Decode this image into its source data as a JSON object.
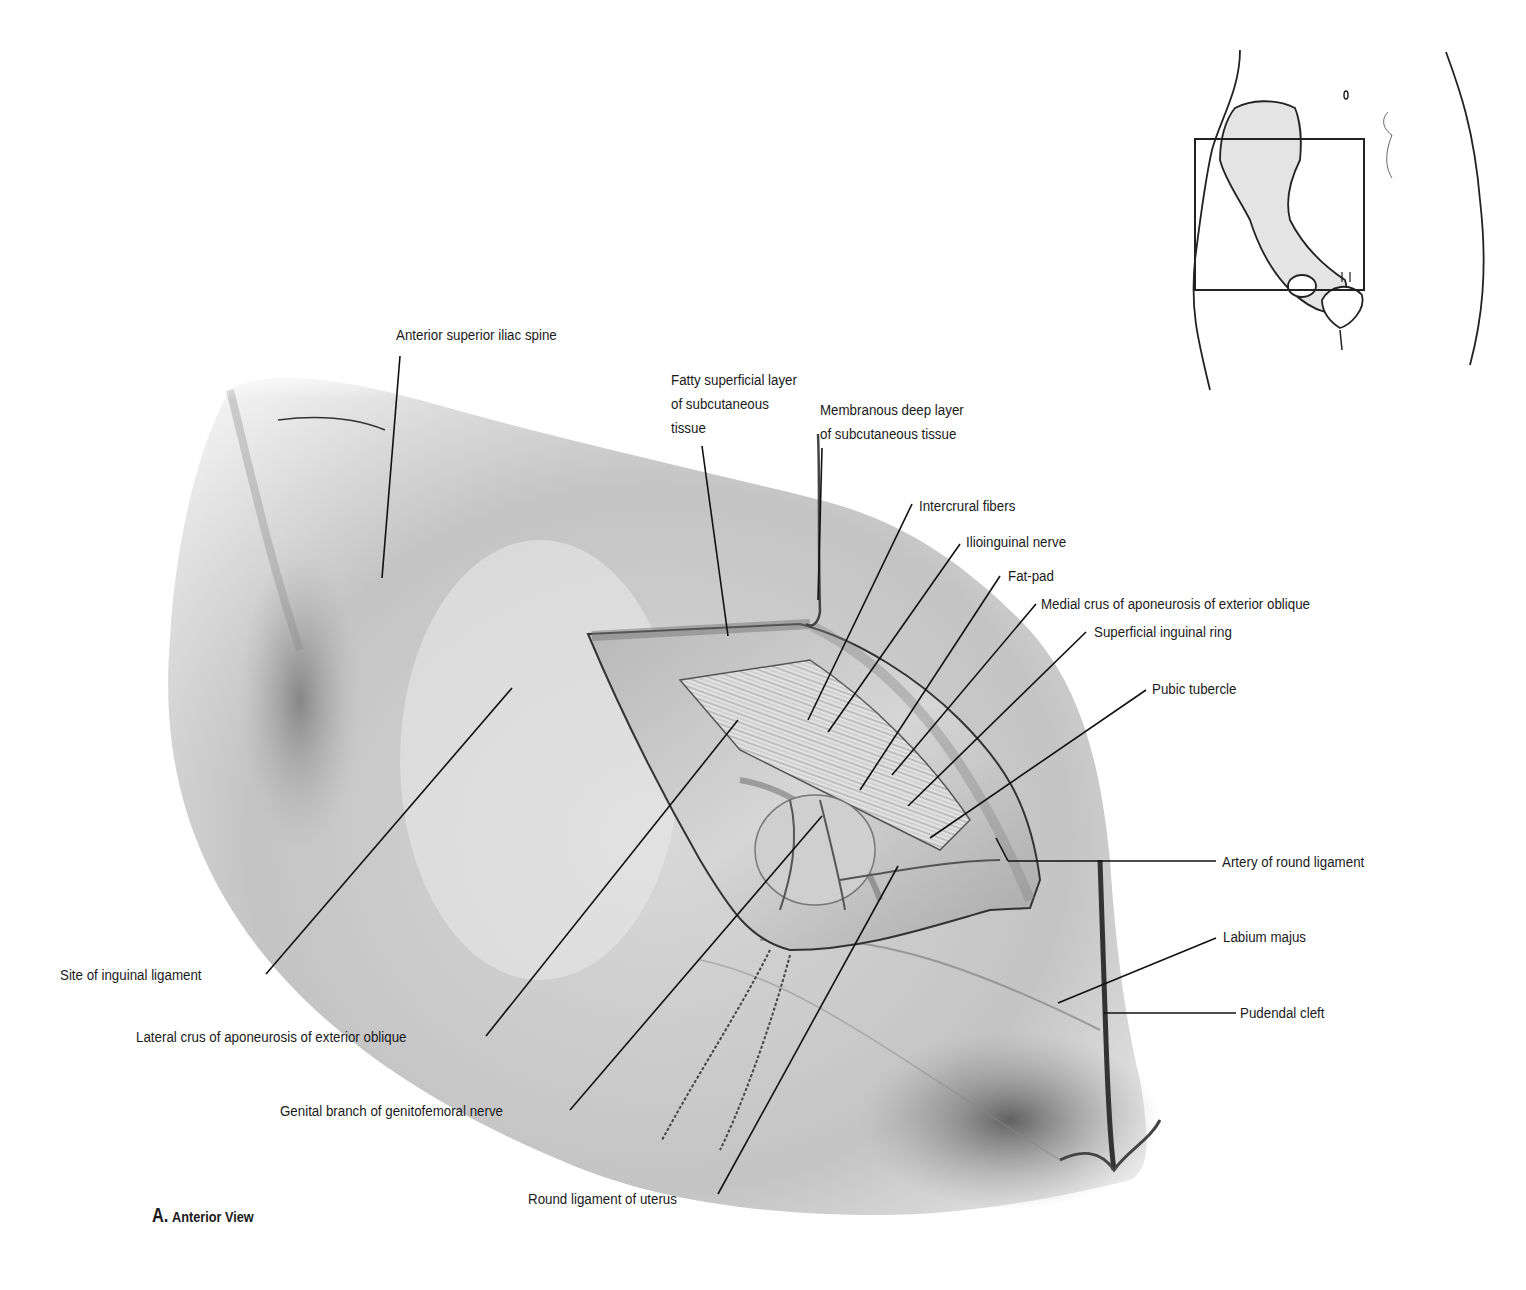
{
  "figure": {
    "caption_letter": "A.",
    "caption_text": "Anterior View",
    "view": "Anterior view of inguinal region (female), superficial dissection",
    "signature": "Dchubb",
    "colors": {
      "background": "#ffffff",
      "ink": "#1a1a1a",
      "skin_shade": "#9a9a9a",
      "leader_line": "#111111"
    }
  },
  "labels": {
    "asis": "Anterior superior iliac spine",
    "fatty_1": "Fatty superficial layer",
    "fatty_2": "of subcutaneous",
    "fatty_3": "tissue",
    "membranous_1": "Membranous deep layer",
    "membranous_2": "of subcutaneous tissue",
    "intercrural": "Intercrural fibers",
    "ilioinguinal": "Ilioinguinal nerve",
    "fatpad": "Fat-pad",
    "medial_crus": "Medial crus of aponeurosis of exterior oblique",
    "superficial_ring": "Superficial inguinal ring",
    "pubic_tubercle": "Pubic tubercle",
    "artery_round": "Artery of round ligament",
    "labium": "Labium majus",
    "pudendal": "Pudendal cleft",
    "site_inguinal": "Site of inguinal ligament",
    "lateral_crus": "Lateral crus of aponeurosis of exterior oblique",
    "genital_branch": "Genital branch of genitofemoral nerve",
    "round_ligament": "Round ligament of uterus"
  },
  "inset": {
    "description": "Orientation sketch of female pelvis with rectangle indicating region shown"
  }
}
